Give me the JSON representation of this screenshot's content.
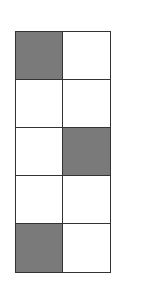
{
  "grid": {
    "rows": 5,
    "columns": 2,
    "shaded_color": "#7a7a7a",
    "empty_color": "#ffffff",
    "line_color": "#333333",
    "cells": [
      [
        true,
        false
      ],
      [
        false,
        false
      ],
      [
        false,
        true
      ],
      [
        false,
        false
      ],
      [
        true,
        false
      ]
    ]
  }
}
